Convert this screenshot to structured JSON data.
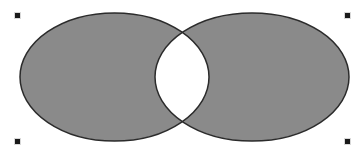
{
  "diagram": {
    "type": "venn",
    "canvas": {
      "width": 361,
      "height": 155,
      "background": "#ffffff"
    },
    "fill_rule": "evenodd",
    "shapes": [
      {
        "name": "left-ellipse",
        "cx": 114.5,
        "cy": 77,
        "rx": 94.5,
        "ry": 64,
        "fill": "#8a8a8a",
        "stroke": "#2b2b2b",
        "stroke_width": 1.5
      },
      {
        "name": "right-ellipse",
        "cx": 252,
        "cy": 77,
        "rx": 97,
        "ry": 64,
        "fill": "#8a8a8a",
        "stroke": "#2b2b2b",
        "stroke_width": 1.5
      }
    ],
    "overlap": {
      "fill": "#ffffff",
      "top_point": [
        181,
        31
      ],
      "bottom_point": [
        181,
        122
      ]
    },
    "selection_handles": [
      {
        "name": "handle-top-left",
        "x": 15,
        "y": 13
      },
      {
        "name": "handle-top-right",
        "x": 345,
        "y": 13
      },
      {
        "name": "handle-bottom-left",
        "x": 15,
        "y": 139
      },
      {
        "name": "handle-bottom-right",
        "x": 345,
        "y": 139
      }
    ],
    "handle_color": "#1a1a1a"
  }
}
